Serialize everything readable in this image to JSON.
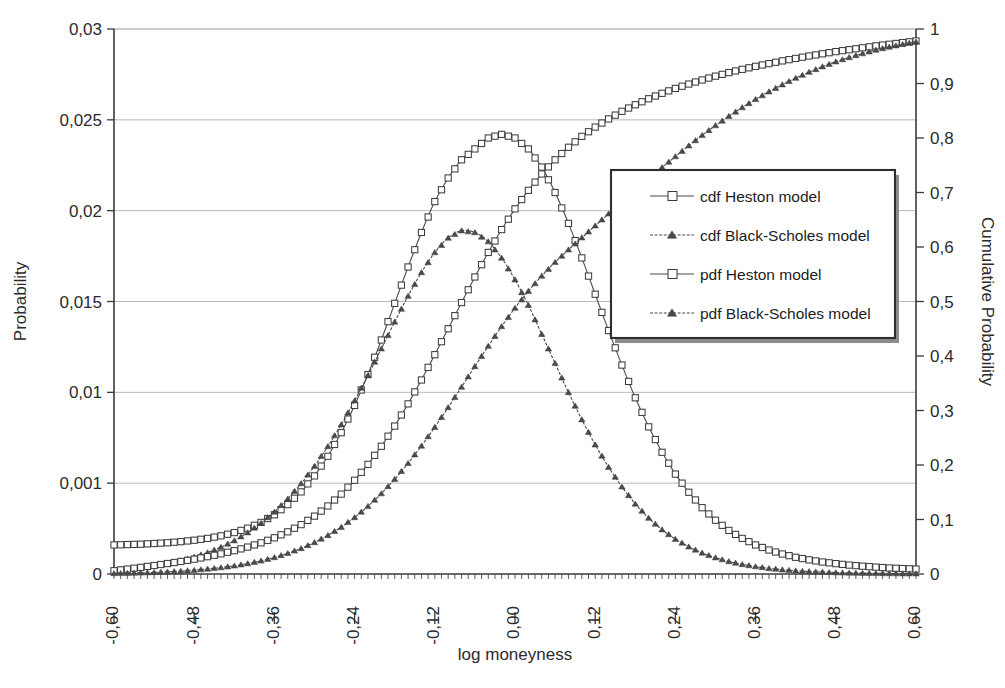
{
  "chart_data": {
    "type": "line",
    "title": "",
    "xlabel": "log moneyness",
    "ylabel": "Probability",
    "y2label": "Cumulative Probability",
    "grid": true,
    "legend_position": "center-right inside plot",
    "xlim": [
      -0.6,
      0.6
    ],
    "ylim": [
      0,
      0.03
    ],
    "y2lim": [
      0,
      1
    ],
    "xticks": [
      "-0,60",
      "-0,48",
      "-0,36",
      "-0,24",
      "-0,12",
      "0,00",
      "0,12",
      "0,24",
      "0,36",
      "0,48",
      "0,60"
    ],
    "xtick_values": [
      -0.6,
      -0.48,
      -0.36,
      -0.24,
      -0.12,
      0.0,
      0.12,
      0.24,
      0.36,
      0.48,
      0.6
    ],
    "yticks": [
      "0",
      "0,001",
      "0,01",
      "0,015",
      "0,02",
      "0,025",
      "0,03"
    ],
    "ytick_values": [
      0,
      0.005,
      0.01,
      0.015,
      0.02,
      0.025,
      0.03
    ],
    "y2ticks": [
      "0",
      "0,1",
      "0,2",
      "0,3",
      "0,4",
      "0,5",
      "0,6",
      "0,7",
      "0,8",
      "0,9",
      "1"
    ],
    "y2tick_values": [
      0,
      0.1,
      0.2,
      0.3,
      0.4,
      0.5,
      0.6,
      0.7,
      0.8,
      0.9,
      1.0
    ],
    "x": [
      -0.6,
      -0.58,
      -0.56,
      -0.54,
      -0.52,
      -0.5,
      -0.48,
      -0.46,
      -0.44,
      -0.42,
      -0.4,
      -0.38,
      -0.36,
      -0.34,
      -0.32,
      -0.3,
      -0.28,
      -0.26,
      -0.24,
      -0.22,
      -0.2,
      -0.18,
      -0.16,
      -0.14,
      -0.12,
      -0.1,
      -0.08,
      -0.06,
      -0.04,
      -0.02,
      0.0,
      0.02,
      0.04,
      0.06,
      0.08,
      0.1,
      0.12,
      0.14,
      0.16,
      0.18,
      0.2,
      0.22,
      0.24,
      0.26,
      0.28,
      0.3,
      0.32,
      0.34,
      0.36,
      0.38,
      0.4,
      0.42,
      0.44,
      0.46,
      0.48,
      0.5,
      0.52,
      0.54,
      0.56,
      0.58,
      0.6
    ],
    "series": [
      {
        "name": "pdf Heston model",
        "axis": "left",
        "marker": "square",
        "dash": false,
        "values": [
          0.0016,
          0.00162,
          0.00164,
          0.00168,
          0.00172,
          0.00178,
          0.00186,
          0.00196,
          0.0021,
          0.00228,
          0.00252,
          0.00284,
          0.00326,
          0.00382,
          0.00452,
          0.0054,
          0.00648,
          0.00778,
          0.00928,
          0.01098,
          0.01288,
          0.0149,
          0.0169,
          0.0188,
          0.0205,
          0.0218,
          0.0228,
          0.0234,
          0.024,
          0.0242,
          0.024,
          0.0234,
          0.0224,
          0.021,
          0.0193,
          0.0174,
          0.0154,
          0.0134,
          0.0115,
          0.0097,
          0.0081,
          0.0067,
          0.0055,
          0.0045,
          0.00365,
          0.00296,
          0.0024,
          0.00196,
          0.0016,
          0.00132,
          0.0011,
          0.00092,
          0.00078,
          0.00066,
          0.00057,
          0.00049,
          0.00043,
          0.00038,
          0.00033,
          0.0003,
          0.00027
        ]
      },
      {
        "name": "pdf Black-Scholes model",
        "axis": "left",
        "marker": "triangle",
        "dash": true,
        "values": [
          0.00022,
          0.00028,
          0.00036,
          0.00046,
          0.00058,
          0.00074,
          0.00094,
          0.00118,
          0.00148,
          0.00184,
          0.00228,
          0.0028,
          0.00342,
          0.00414,
          0.00498,
          0.00594,
          0.00702,
          0.00822,
          0.00954,
          0.01094,
          0.0124,
          0.01388,
          0.0153,
          0.0166,
          0.0177,
          0.0185,
          0.0189,
          0.0188,
          0.0183,
          0.0174,
          0.0162,
          0.0148,
          0.0132,
          0.0116,
          0.01,
          0.0085,
          0.00712,
          0.00588,
          0.0048,
          0.00386,
          0.00308,
          0.00244,
          0.00192,
          0.0015,
          0.00116,
          0.0009,
          0.00069,
          0.00053,
          0.00041,
          0.00031,
          0.00024,
          0.00018,
          0.00014,
          0.00011,
          8e-05,
          6e-05,
          5e-05,
          4e-05,
          3e-05,
          2e-05,
          2e-05
        ]
      },
      {
        "name": "cdf Heston model",
        "axis": "right",
        "marker": "square",
        "dash": false,
        "values": [
          0.006,
          0.009,
          0.0122,
          0.0156,
          0.0192,
          0.023,
          0.0272,
          0.0318,
          0.037,
          0.0428,
          0.0494,
          0.0572,
          0.0664,
          0.0774,
          0.0906,
          0.1062,
          0.1248,
          0.1466,
          0.172,
          0.2012,
          0.2344,
          0.2714,
          0.3122,
          0.356,
          0.4024,
          0.45,
          0.498,
          0.545,
          0.59,
          0.632,
          0.67,
          0.704,
          0.734,
          0.76,
          0.783,
          0.803,
          0.82,
          0.835,
          0.849,
          0.861,
          0.872,
          0.882,
          0.891,
          0.899,
          0.9065,
          0.9135,
          0.92,
          0.926,
          0.9315,
          0.9365,
          0.9415,
          0.946,
          0.9505,
          0.9545,
          0.9585,
          0.962,
          0.9655,
          0.969,
          0.972,
          0.975,
          0.978
        ]
      },
      {
        "name": "cdf Black-Scholes model",
        "axis": "right",
        "marker": "triangle",
        "dash": true,
        "values": [
          0.001,
          0.0015,
          0.0022,
          0.003,
          0.0041,
          0.0054,
          0.0071,
          0.0092,
          0.0118,
          0.0151,
          0.0192,
          0.0242,
          0.0304,
          0.038,
          0.0471,
          0.058,
          0.0709,
          0.0861,
          0.1038,
          0.1243,
          0.1476,
          0.1739,
          0.2031,
          0.2351,
          0.2694,
          0.3057,
          0.3431,
          0.3809,
          0.4183,
          0.4542,
          0.488,
          0.519,
          0.547,
          0.572,
          0.595,
          0.617,
          0.639,
          0.661,
          0.683,
          0.704,
          0.725,
          0.746,
          0.766,
          0.786,
          0.805,
          0.823,
          0.84,
          0.856,
          0.871,
          0.885,
          0.898,
          0.91,
          0.921,
          0.931,
          0.94,
          0.948,
          0.955,
          0.9615,
          0.967,
          0.972,
          0.9765
        ]
      }
    ]
  },
  "legend": {
    "entries": [
      {
        "label": "cdf Heston model",
        "marker": "square",
        "dash": false
      },
      {
        "label": "cdf Black-Scholes model",
        "marker": "triangle",
        "dash": true
      },
      {
        "label": "pdf Heston model",
        "marker": "square",
        "dash": false
      },
      {
        "label": "pdf Black-Scholes model",
        "marker": "triangle",
        "dash": true
      }
    ]
  },
  "colors": {
    "line": "#4a4a4a",
    "marker_fill": "#ffffff",
    "marker_stroke": "#3d3d3d",
    "axis": "#3a3a3a",
    "grid": "#b9b9b9",
    "text": "#2b2b2b",
    "background": "#ffffff"
  }
}
